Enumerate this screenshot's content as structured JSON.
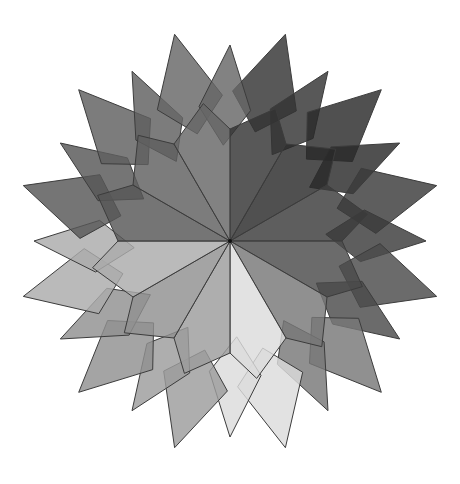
{
  "figure": {
    "width": 460,
    "height": 484,
    "background": "#ffffff",
    "center": [
      230,
      241
    ],
    "stroke_color": "#3c3c3c",
    "stroke_width": 1,
    "fill_opacity": 0.82,
    "sector_count": 12,
    "sector_angle_step_deg": 30,
    "radii": {
      "ray_end": 112,
      "body_outer": 150,
      "ray_tip": 196,
      "mid_tip": 214
    },
    "sectors": [
      {
        "start_deg": 0,
        "shade": "#333333"
      },
      {
        "start_deg": 30,
        "shade": "#2a2a2a"
      },
      {
        "start_deg": 60,
        "shade": "#3a3a3a"
      },
      {
        "start_deg": 90,
        "shade": "#4a4a4a"
      },
      {
        "start_deg": 120,
        "shade": "#777777"
      },
      {
        "start_deg": 150,
        "shade": "#dcdcdc"
      },
      {
        "start_deg": 180,
        "shade": "#9c9c9c"
      },
      {
        "start_deg": 210,
        "shade": "#909090"
      },
      {
        "start_deg": 240,
        "shade": "#ababab"
      },
      {
        "start_deg": 270,
        "shade": "#575757"
      },
      {
        "start_deg": 300,
        "shade": "#5f5f5f"
      },
      {
        "start_deg": 330,
        "shade": "#676767"
      }
    ]
  }
}
